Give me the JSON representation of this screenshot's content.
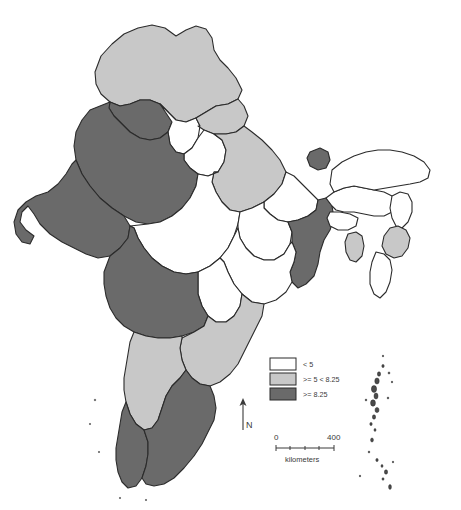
{
  "map": {
    "title": "India choropleth map",
    "colors": {
      "class_low": "#ffffff",
      "class_mid": "#c8c8c8",
      "class_high": "#6a6a6a",
      "border": "#2b2b2b",
      "background": "#ffffff",
      "text": "#3a3a3a"
    },
    "legend": {
      "items": [
        {
          "label": "< 5",
          "swatch": "#ffffff",
          "class_key": "class_low"
        },
        {
          "label": ">= 5 < 8.25",
          "swatch": "#c8c8c8",
          "class_key": "class_mid"
        },
        {
          "label": ">= 8.25",
          "swatch": "#6a6a6a",
          "class_key": "class_high"
        }
      ]
    },
    "north_arrow": {
      "label": "N"
    },
    "scale_bar": {
      "min_label": "0",
      "max_label": "400",
      "units_label": "kilometers"
    },
    "regions": [
      {
        "name": "jammu-kashmir",
        "class_key": "class_mid"
      },
      {
        "name": "himachal-pradesh",
        "class_key": "class_high"
      },
      {
        "name": "punjab",
        "class_key": "class_low"
      },
      {
        "name": "haryana",
        "class_key": "class_low"
      },
      {
        "name": "uttarakhand",
        "class_key": "class_mid"
      },
      {
        "name": "rajasthan",
        "class_key": "class_high"
      },
      {
        "name": "uttar-pradesh",
        "class_key": "class_mid"
      },
      {
        "name": "bihar",
        "class_key": "class_low"
      },
      {
        "name": "sikkim",
        "class_key": "class_high"
      },
      {
        "name": "west-bengal",
        "class_key": "class_high"
      },
      {
        "name": "jharkhand",
        "class_key": "class_low"
      },
      {
        "name": "odisha",
        "class_key": "class_low"
      },
      {
        "name": "chhattisgarh",
        "class_key": "class_low"
      },
      {
        "name": "madhya-pradesh",
        "class_key": "class_low"
      },
      {
        "name": "gujarat",
        "class_key": "class_high"
      },
      {
        "name": "maharashtra",
        "class_key": "class_high"
      },
      {
        "name": "telangana-andhra-pradesh",
        "class_key": "class_mid"
      },
      {
        "name": "karnataka",
        "class_key": "class_mid"
      },
      {
        "name": "kerala",
        "class_key": "class_high"
      },
      {
        "name": "tamil-nadu",
        "class_key": "class_high"
      },
      {
        "name": "assam",
        "class_key": "class_low"
      },
      {
        "name": "arunachal-pradesh",
        "class_key": "class_low"
      },
      {
        "name": "nagaland",
        "class_key": "class_low"
      },
      {
        "name": "manipur",
        "class_key": "class_mid"
      },
      {
        "name": "mizoram",
        "class_key": "class_low"
      },
      {
        "name": "tripura",
        "class_key": "class_mid"
      },
      {
        "name": "meghalaya",
        "class_key": "class_low"
      },
      {
        "name": "andaman-nicobar-islands",
        "class_key": "class_high"
      }
    ]
  }
}
